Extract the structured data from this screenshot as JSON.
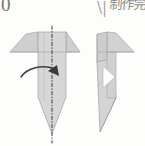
{
  "page": {
    "kind": "origami-instruction-diagram",
    "background_color": "#fdfdfc",
    "step_number": "0",
    "caption_cjk": "制作完",
    "stroke_marks": "\\|"
  },
  "palette": {
    "paper_fill": "#d3d3d3",
    "paper_fill_light": "#dcdcdc",
    "paper_fill_dark": "#c4c4c4",
    "paper_edge": "#9a9a9a",
    "fold_line": "#4a4a4a",
    "arrow": "#3d3d3d",
    "white_gap": "#fefefe"
  },
  "figures": [
    {
      "id": "left-figure",
      "name": "unfolded-model-with-fold-line",
      "description": "Symmetric origami model with two angled flaps at top and a pointed bottom tip",
      "has_fold_line": true,
      "has_arrow": true,
      "fold_line_orientation": "vertical",
      "fold_line_style": "dash-dot",
      "arrow_label": "fold-in-half-arrow",
      "arrow_direction": "left-to-right"
    },
    {
      "id": "right-figure",
      "name": "folded-result-model",
      "description": "Result after folding in half: single right flap, narrow body with triangular opening and slanted point",
      "has_fold_line": false,
      "has_arrow": false,
      "has_opening": true,
      "opening_shape": "triangle"
    }
  ],
  "geometry": {
    "left": {
      "body_left_x": 38,
      "body_right_x": 66,
      "flap_left_x": 10,
      "flap_right_x": 72,
      "top_y": 32,
      "flap_bottom_y": 52,
      "taper_start_y": 97,
      "tip_y": 134,
      "axis_x": 52
    },
    "right": {
      "body_left_x": 97,
      "body_right_x": 116,
      "flap_right_x": 134,
      "top_y": 32,
      "flap_bottom_y": 52,
      "tip_y": 132
    }
  }
}
